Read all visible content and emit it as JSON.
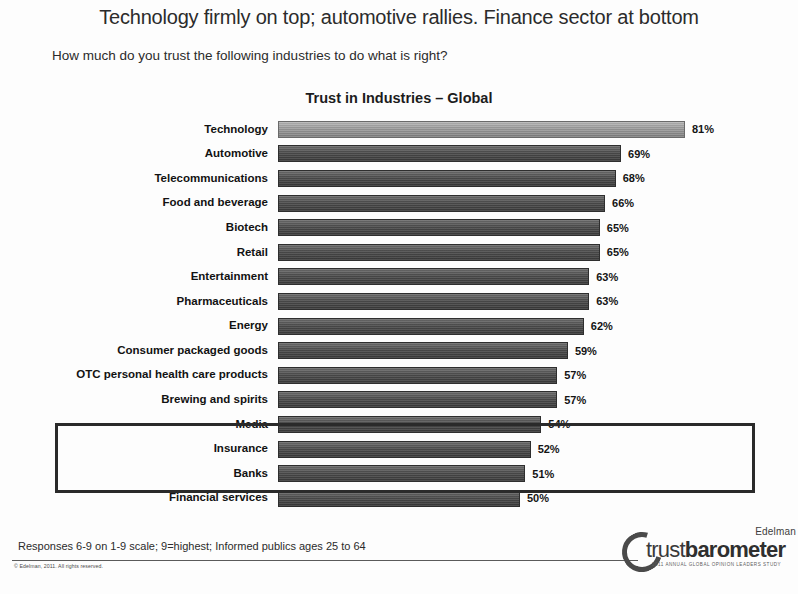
{
  "slide": {
    "headline": "Technology firmly on top; automotive rallies. Finance sector at bottom",
    "question": "How much do you trust the following industries to do what is right?",
    "footnote": "Responses 6-9 on 1-9 scale; 9=highest; Informed publics ages 25 to 64",
    "copyright": "© Edelman, 2011. All rights reserved."
  },
  "logo": {
    "brand": "Edelman",
    "wordmark_light": "trust",
    "wordmark_bold": "barometer",
    "tagline": "2011 ANNUAL GLOBAL OPINION LEADERS STUDY"
  },
  "colors": {
    "bar": "#4b4b4b",
    "bar_highlight": "#9b9b9b",
    "box_outline": "#2a2a2a",
    "text": "#1a1a1a"
  },
  "chart_data": {
    "type": "bar",
    "orientation": "horizontal",
    "title": "Trust in Industries – Global",
    "subtitle": "How much do you trust the following industries to do what is right?",
    "xlabel": "",
    "ylabel": "",
    "xlim": [
      0,
      100
    ],
    "grid": false,
    "legend": null,
    "value_suffix": "%",
    "categories": [
      "Technology",
      "Automotive",
      "Telecommunications",
      "Food and beverage",
      "Biotech",
      "Retail",
      "Entertainment",
      "Pharmaceuticals",
      "Energy",
      "Consumer packaged goods",
      "OTC personal health care products",
      "Brewing and spirits",
      "Media",
      "Insurance",
      "Banks",
      "Financial services"
    ],
    "values": [
      81,
      69,
      68,
      66,
      65,
      65,
      63,
      63,
      62,
      59,
      57,
      57,
      54,
      52,
      51,
      50
    ],
    "labels": [
      "81%",
      "69%",
      "68%",
      "66%",
      "65%",
      "65%",
      "63%",
      "63%",
      "62%",
      "59%",
      "57%",
      "57%",
      "54%",
      "52%",
      "51%",
      "50%"
    ],
    "annotations": [
      {
        "type": "box",
        "covers": [
          "Insurance",
          "Banks",
          "Financial services"
        ],
        "note": "Finance sector at bottom"
      }
    ]
  }
}
